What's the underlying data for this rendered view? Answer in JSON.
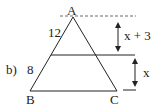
{
  "figure": {
    "part_label": "b)",
    "vertices": {
      "A": "A",
      "B": "B",
      "C": "C"
    },
    "side_labels": {
      "upper_left": "12",
      "lower_left": "8"
    },
    "heights": {
      "upper": "x + 3",
      "lower": "x"
    },
    "colors": {
      "stroke": "#222222",
      "background": "#ffffff"
    }
  }
}
